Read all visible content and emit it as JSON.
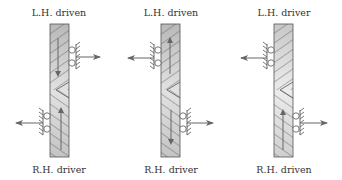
{
  "diagram": {
    "type": "helical gear thrust directions",
    "colors": {
      "bar_fill_top": "#bdbdbd",
      "bar_fill_bottom": "#e6e6e6",
      "outline": "#555555",
      "arrow": "#666666",
      "text": "#333333"
    },
    "gears": [
      {
        "top_label": "L.H. driven",
        "bottom_label": "R.H. driver",
        "top_bearing_side": "right",
        "bottom_bearing_side": "left",
        "top_rotation_arrow": "down",
        "bottom_rotation_arrow": "up",
        "top_thrust": "right",
        "bottom_thrust": "left"
      },
      {
        "top_label": "L.H. driven",
        "bottom_label": "R.H. driver",
        "top_bearing_side": "left",
        "bottom_bearing_side": "right",
        "top_rotation_arrow": "up",
        "bottom_rotation_arrow": "down",
        "top_thrust": "left",
        "bottom_thrust": "right"
      },
      {
        "top_label": "L.H. driver",
        "bottom_label": "R.H. driven",
        "top_bearing_side": "left",
        "bottom_bearing_side": "right",
        "top_rotation_arrow": "none",
        "bottom_rotation_arrow": "up",
        "top_thrust": "left",
        "bottom_thrust": "right"
      }
    ]
  }
}
